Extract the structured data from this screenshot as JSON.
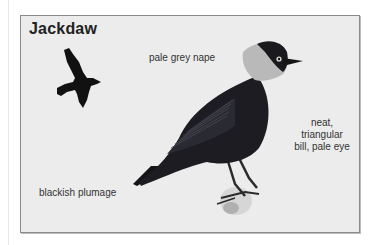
{
  "title": "Jackdaw",
  "labels": {
    "nape": "pale grey nape",
    "plumage": "blackish plumage",
    "bill_line1": "neat, triangular",
    "bill_line2": "bill, pale eye"
  },
  "illustrations": {
    "flying": "jackdaw-flight-silhouette",
    "perched": "jackdaw-perched-illustration"
  },
  "colors": {
    "panel_bg": "#ececec",
    "border": "#8a8a8a",
    "plumage": "#1a1a1e",
    "nape": "#b9b9b9"
  }
}
